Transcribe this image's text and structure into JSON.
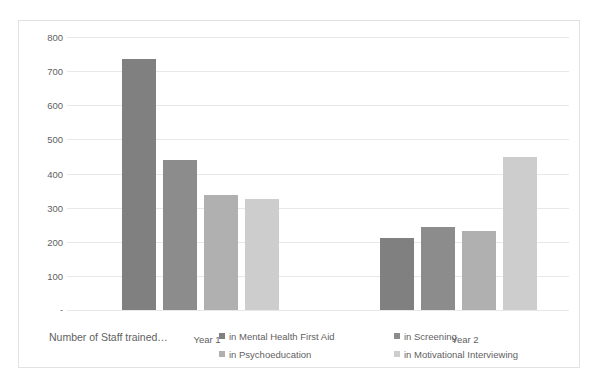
{
  "chart_data": {
    "type": "bar",
    "title": "",
    "xlabel": "Number of Staff trained…",
    "ylabel": "",
    "categories": [
      "Year 1",
      "Year 2"
    ],
    "ylim": [
      0,
      800
    ],
    "yticks": [
      "800",
      "700",
      "600",
      "500",
      "400",
      "300",
      "200",
      "100",
      "-"
    ],
    "ytick_values": [
      800,
      700,
      600,
      500,
      400,
      300,
      200,
      100,
      0
    ],
    "grid": true,
    "legend_position": "bottom",
    "series": [
      {
        "name": "in Mental Health First Aid",
        "color": "#808080",
        "values": [
          735,
          212
        ]
      },
      {
        "name": "in Screening",
        "color": "#8c8c8c",
        "values": [
          440,
          243
        ]
      },
      {
        "name": "in Psychoeducation",
        "color": "#b0b0b0",
        "values": [
          337,
          232
        ]
      },
      {
        "name": "in Motivational Interviewing",
        "color": "#cdcdcd",
        "values": [
          325,
          449
        ]
      }
    ]
  },
  "legend_order": [
    {
      "index": 0,
      "label": "in Mental Health First Aid",
      "color": "#808080"
    },
    {
      "index": 1,
      "label": "in Screening",
      "color": "#8c8c8c"
    },
    {
      "index": 2,
      "label": "in Psychoeducation",
      "color": "#b0b0b0"
    },
    {
      "index": 3,
      "label": "in Motivational Interviewing",
      "color": "#cdcdcd"
    }
  ]
}
